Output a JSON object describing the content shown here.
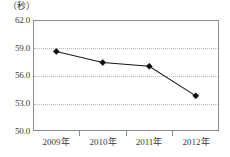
{
  "chart_data": {
    "type": "line",
    "title": "",
    "subtitle": "",
    "xlabel": "",
    "ylabel": "（秒）",
    "unit_label": "（秒）",
    "categories": [
      "2009年",
      "2010年",
      "2011年",
      "2012年"
    ],
    "values": [
      58.6,
      57.4,
      57.0,
      53.8
    ],
    "series": [
      {
        "name": "",
        "values": [
          58.6,
          57.4,
          57.0,
          53.8
        ]
      }
    ],
    "ylim": [
      50.0,
      62.0
    ],
    "ytick_labels": [
      "62.0",
      "59.0",
      "56.0",
      "53.0",
      "50.0"
    ],
    "ytick_values": [
      62.0,
      59.0,
      56.0,
      53.0,
      50.0
    ],
    "xtick_labels": [
      "2009年",
      "2010年",
      "2011年",
      "2012年"
    ],
    "grid": true,
    "grid_style": "dotted-horizontal",
    "legend": false,
    "legend_position": "none",
    "marker": "diamond",
    "line_color": "#1a1a1a",
    "marker_color": "#0d0d0d",
    "grid_color": "#b9b9b9",
    "frame_color": "#8d8d8d",
    "background_color": "#ffffff"
  }
}
